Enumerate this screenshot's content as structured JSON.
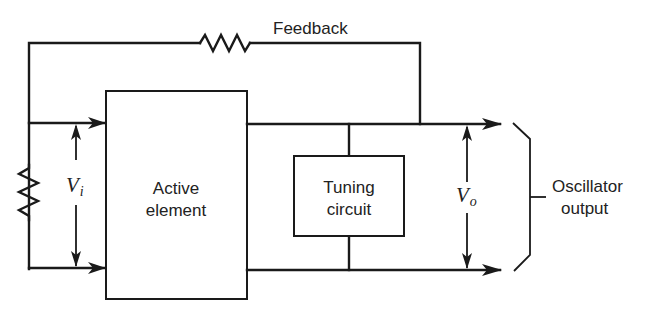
{
  "diagram": {
    "labels": {
      "feedback": "Feedback",
      "active_element_line1": "Active",
      "active_element_line2": "element",
      "tuning_circuit_line1": "Tuning",
      "tuning_circuit_line2": "circuit",
      "input_voltage_symbol": "V",
      "input_voltage_subscript": "i",
      "output_voltage_symbol": "V",
      "output_voltage_subscript": "o",
      "output_line1": "Oscillator",
      "output_line2": "output"
    },
    "components": [
      {
        "id": "feedback-resistor",
        "type": "resistor"
      },
      {
        "id": "input-resistor",
        "type": "resistor"
      },
      {
        "id": "active-element",
        "type": "block"
      },
      {
        "id": "tuning-circuit",
        "type": "block"
      }
    ],
    "colors": {
      "line": "#1a1a1a",
      "background": "#ffffff"
    }
  }
}
